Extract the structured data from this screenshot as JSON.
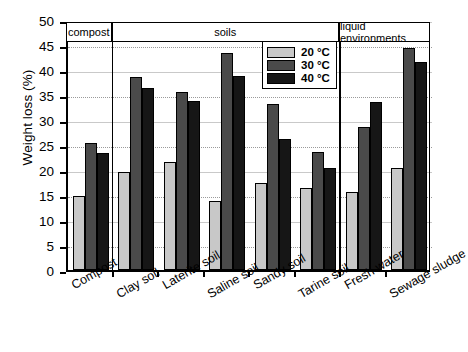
{
  "chart_data": {
    "type": "bar",
    "title": "",
    "xlabel": "",
    "ylabel": "Weight loss (%)",
    "ylim": [
      0,
      50
    ],
    "ytick_step": 5,
    "yticks": [
      0,
      5,
      10,
      15,
      20,
      25,
      30,
      35,
      40,
      45,
      50
    ],
    "grid": true,
    "legend_position": "top-right-inside",
    "categories": [
      "Compost",
      "Clay soil",
      "Laterite soil",
      "Saline soil",
      "Sandy soil",
      "Tarine soil",
      "Fresh water",
      "Sewage sludge"
    ],
    "series": [
      {
        "name": "20 °C",
        "color": "#c8c8c8",
        "values": [
          14.9,
          19.7,
          21.6,
          13.8,
          17.5,
          16.5,
          15.6,
          20.4
        ]
      },
      {
        "name": "30 °C",
        "color": "#4a4a4a",
        "values": [
          25.4,
          38.7,
          35.6,
          43.4,
          33.2,
          23.6,
          28.6,
          44.5
        ]
      },
      {
        "name": "40 °C",
        "color": "#161616",
        "values": [
          23.4,
          36.4,
          33.8,
          38.8,
          26.2,
          20.5,
          33.6,
          41.7
        ]
      }
    ],
    "group_bands": [
      {
        "label": "compost",
        "categories": [
          "Compost"
        ]
      },
      {
        "label": "soils",
        "categories": [
          "Clay soil",
          "Laterite soil",
          "Saline soil",
          "Sandy soil",
          "Tarine soil"
        ]
      },
      {
        "label": "liquid environments",
        "categories": [
          "Fresh water",
          "Sewage sludge"
        ]
      }
    ]
  }
}
